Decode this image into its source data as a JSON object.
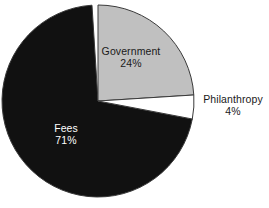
{
  "chart_data": {
    "type": "pie",
    "title": "",
    "subtitle": "",
    "xlabel": "",
    "ylabel": "",
    "grid": false,
    "legend_position": "none",
    "labels_inline": true,
    "start_angle_deg": 0,
    "direction": "clockwise",
    "categories": [
      "Government",
      "Philanthropy",
      "Fees"
    ],
    "values": [
      24,
      4,
      71
    ],
    "value_unit": "%",
    "slices": [
      {
        "label": "Government",
        "value": 24,
        "value_text": "24%",
        "color": "#c0c0c0",
        "text_color": "#1a1a1a",
        "start_angle_deg": 0,
        "end_angle_deg": 86.4
      },
      {
        "label": "Philanthropy",
        "value": 4,
        "value_text": "4%",
        "color": "#ffffff",
        "text_color": "#1a1a1a",
        "start_angle_deg": 86.4,
        "end_angle_deg": 100.8
      },
      {
        "label": "Fees",
        "value": 71,
        "value_text": "71%",
        "color": "#111111",
        "text_color": "#ffffff",
        "start_angle_deg": 100.8,
        "end_angle_deg": 356.4
      }
    ],
    "geometry": {
      "center_x": 98,
      "center_y": 101,
      "radius": 96,
      "outline_color": "#3a3a3a",
      "outline_width": 1
    },
    "annotations": [
      {
        "name": "government",
        "text": "Government",
        "value_text": "24%"
      },
      {
        "name": "philanthropy",
        "text": "Philanthropy",
        "value_text": "4%"
      },
      {
        "name": "fees",
        "text": "Fees",
        "value_text": "71%"
      }
    ]
  },
  "labels": {
    "government": {
      "name": "Government",
      "value": "24%"
    },
    "philanthropy": {
      "name": "Philanthropy",
      "value": "4%"
    },
    "fees": {
      "name": "Fees",
      "value": "71%"
    }
  },
  "colors": {
    "government": "#c0c0c0",
    "philanthropy": "#ffffff",
    "fees": "#111111",
    "outline": "#3a3a3a",
    "background": "#ffffff"
  }
}
